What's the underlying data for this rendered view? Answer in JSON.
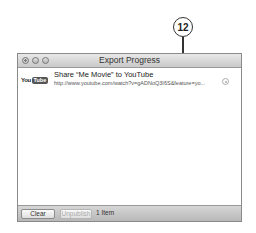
{
  "callout": {
    "number": "12"
  },
  "window": {
    "title": "Export Progress",
    "traffic_lights": [
      "close",
      "minimize",
      "zoom"
    ]
  },
  "items": [
    {
      "service_logo": {
        "you": "You",
        "tube": "Tube"
      },
      "title": "Share “Me Movie” to YouTube",
      "link": "http://www.youtube.com/watch?v=gADNoQ3I6S&feature=yo...",
      "icon": "reveal-icon"
    }
  ],
  "bottom_bar": {
    "clear_label": "Clear",
    "unpublish_label": "Unpublish",
    "item_count": "1 Item"
  }
}
